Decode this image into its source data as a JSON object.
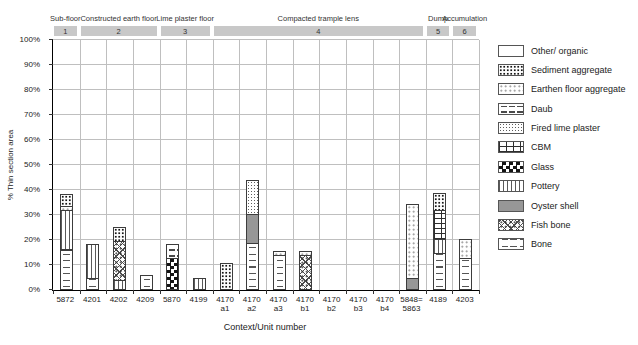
{
  "chart_data": {
    "type": "bar",
    "stacked": true,
    "title": "",
    "xlabel": "Context/Unit number",
    "ylabel": "% Thin section area",
    "ylim": [
      0,
      100
    ],
    "ytick_step": 10,
    "ytick_suffix": "%",
    "grid": true,
    "legend_position": "right",
    "legend": [
      {
        "label": "Other/ organic",
        "pattern": "other"
      },
      {
        "label": "Sediment aggregate",
        "pattern": "sediment"
      },
      {
        "label": "Earthen floor aggregate",
        "pattern": "earthen"
      },
      {
        "label": "Daub",
        "pattern": "daub"
      },
      {
        "label": "Fired lime plaster",
        "pattern": "firedlime"
      },
      {
        "label": "CBM",
        "pattern": "cbm"
      },
      {
        "label": "Glass",
        "pattern": "glass"
      },
      {
        "label": "Pottery",
        "pattern": "pottery"
      },
      {
        "label": "Oyster shell",
        "pattern": "oyster"
      },
      {
        "label": "Fish bone",
        "pattern": "fishbone"
      },
      {
        "label": "Bone",
        "pattern": "bone"
      }
    ],
    "groups": [
      {
        "label": "Sub-floor",
        "number": "1",
        "start": 0,
        "span": 1
      },
      {
        "label": "Constructed earth floor",
        "number": "2",
        "start": 1,
        "span": 3
      },
      {
        "label": "Lime plaster floor",
        "number": "3",
        "start": 4,
        "span": 2
      },
      {
        "label": "Compacted trample lens",
        "number": "4",
        "start": 6,
        "span": 8
      },
      {
        "label": "Dump",
        "number": "5",
        "start": 14,
        "span": 1
      },
      {
        "label": "Accumulation",
        "number": "6",
        "start": 15,
        "span": 1
      }
    ],
    "categories": [
      {
        "label_lines": [
          "5872"
        ],
        "segments": [
          {
            "material": "Bone",
            "value": 16
          },
          {
            "material": "Fish bone",
            "value": 1
          },
          {
            "material": "Pottery",
            "value": 16
          },
          {
            "material": "Earthen floor aggregate",
            "value": 2
          },
          {
            "material": "Sediment aggregate",
            "value": 5
          }
        ]
      },
      {
        "label_lines": [
          "4201"
        ],
        "segments": [
          {
            "material": "Bone",
            "value": 5
          },
          {
            "material": "Pottery",
            "value": 14
          }
        ]
      },
      {
        "label_lines": [
          "4202"
        ],
        "segments": [
          {
            "material": "Pottery",
            "value": 4
          },
          {
            "material": "Fish bone",
            "value": 16
          },
          {
            "material": "Sediment aggregate",
            "value": 6
          }
        ]
      },
      {
        "label_lines": [
          "4209"
        ],
        "segments": [
          {
            "material": "Bone",
            "value": 6
          }
        ]
      },
      {
        "label_lines": [
          "5870"
        ],
        "segments": [
          {
            "material": "Glass",
            "value": 13
          },
          {
            "material": "Daub",
            "value": 6
          }
        ]
      },
      {
        "label_lines": [
          "4199"
        ],
        "segments": [
          {
            "material": "Pottery",
            "value": 5
          }
        ]
      },
      {
        "label_lines": [
          "4170",
          "a1"
        ],
        "segments": [
          {
            "material": "Sediment aggregate",
            "value": 11
          }
        ]
      },
      {
        "label_lines": [
          "4170",
          "a2"
        ],
        "segments": [
          {
            "material": "Bone",
            "value": 19
          },
          {
            "material": "Oyster shell",
            "value": 12
          },
          {
            "material": "Fired lime plaster",
            "value": 14
          }
        ]
      },
      {
        "label_lines": [
          "4170",
          "a3"
        ],
        "segments": [
          {
            "material": "Bone",
            "value": 14
          },
          {
            "material": "Earthen floor aggregate",
            "value": 2
          }
        ]
      },
      {
        "label_lines": [
          "4170",
          "b1"
        ],
        "segments": [
          {
            "material": "Fish bone",
            "value": 14
          },
          {
            "material": "Earthen floor aggregate",
            "value": 2
          }
        ]
      },
      {
        "label_lines": [
          "4170",
          "b2"
        ],
        "segments": []
      },
      {
        "label_lines": [
          "4170",
          "b3"
        ],
        "segments": []
      },
      {
        "label_lines": [
          "4170",
          "b4"
        ],
        "segments": []
      },
      {
        "label_lines": [
          "5848=",
          "5863"
        ],
        "segments": [
          {
            "material": "Oyster shell",
            "value": 5
          },
          {
            "material": "Earthen floor aggregate",
            "value": 30
          }
        ]
      },
      {
        "label_lines": [
          "4189"
        ],
        "segments": [
          {
            "material": "Bone",
            "value": 15
          },
          {
            "material": "Pottery",
            "value": 6
          },
          {
            "material": "CBM",
            "value": 12
          },
          {
            "material": "Sediment aggregate",
            "value": 7
          }
        ]
      },
      {
        "label_lines": [
          "4203"
        ],
        "segments": [
          {
            "material": "Bone",
            "value": 13
          },
          {
            "material": "Earthen floor aggregate",
            "value": 8
          }
        ]
      }
    ]
  }
}
